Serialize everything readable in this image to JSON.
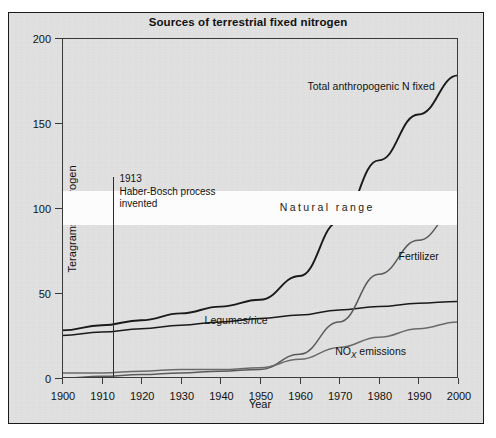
{
  "figure": {
    "title": "Sources of terrestrial fixed nitrogen",
    "xlabel": "Year",
    "ylabel": "Teragrams of nitrogen"
  },
  "annotations": {
    "haber_bosch": {
      "year_text": "1913",
      "line1": "Haber-Bosch process",
      "line2": "invented",
      "x": 1913
    },
    "natural_range": {
      "label": "Natural range",
      "low": 90,
      "high": 110
    }
  },
  "series_labels": {
    "total": "Total anthropogenic N fixed",
    "fertilizer": "Fertilizer",
    "legumes": "Legumes/rice",
    "nox_prefix": "NO",
    "nox_sub": "X",
    "nox_suffix": " emissions"
  },
  "colors": {
    "background": "#e3e3e3",
    "band": "#fcfcfc",
    "axis": "#3a3a3a",
    "total_line": "#1a1a1a",
    "legumes_line": "#1a1a1a",
    "fertilizer_line": "#5a5a5a",
    "nox_line": "#6a6a6a",
    "text": "#121212"
  },
  "chart_data": {
    "type": "line",
    "title": "Sources of terrestrial fixed nitrogen",
    "xlabel": "Year",
    "ylabel": "Teragrams of nitrogen",
    "xlim": [
      1900,
      2000
    ],
    "ylim": [
      0,
      200
    ],
    "xticks": [
      1900,
      1910,
      1920,
      1930,
      1940,
      1950,
      1960,
      1970,
      1980,
      1990,
      2000
    ],
    "yticks": [
      0,
      50,
      100,
      150,
      200
    ],
    "grid": false,
    "legend": "inline-labels",
    "x": [
      1900,
      1910,
      1920,
      1930,
      1940,
      1950,
      1960,
      1970,
      1980,
      1990,
      2000
    ],
    "series": [
      {
        "name": "Total anthropogenic N fixed",
        "values": [
          28,
          31,
          34,
          38,
          42,
          46,
          60,
          92,
          128,
          155,
          178
        ]
      },
      {
        "name": "Legumes/rice",
        "values": [
          25,
          27,
          29,
          31,
          33,
          35,
          37,
          40,
          42,
          44,
          45
        ]
      },
      {
        "name": "Fertilizer",
        "values": [
          0,
          1,
          2,
          3,
          4,
          5,
          14,
          33,
          61,
          81,
          100
        ]
      },
      {
        "name": "NOx emissions",
        "values": [
          3,
          3,
          4,
          5,
          5,
          6,
          11,
          18,
          24,
          29,
          33
        ]
      }
    ],
    "bands": [
      {
        "name": "Natural range",
        "ymin": 90,
        "ymax": 110
      }
    ],
    "annotations": [
      {
        "text": "1913 Haber-Bosch process invented",
        "x": 1913
      }
    ]
  }
}
